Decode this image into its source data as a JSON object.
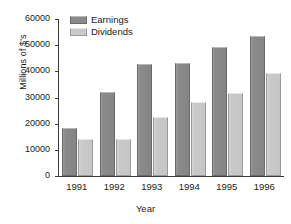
{
  "chart_data": {
    "type": "bar",
    "title": "",
    "xlabel": "Year",
    "ylabel": "Millions of $'s",
    "categories": [
      "1991",
      "1992",
      "1993",
      "1994",
      "1995",
      "1996"
    ],
    "series": [
      {
        "name": "Earnings",
        "color": "#8a8a8a",
        "values": [
          18500,
          32000,
          42800,
          43300,
          49200,
          53500
        ]
      },
      {
        "name": "Dividends",
        "color": "#c9c9c9",
        "values": [
          14200,
          14200,
          22400,
          28400,
          31600,
          39300
        ]
      }
    ],
    "ylim": [
      0,
      60000
    ],
    "yticks": [
      0,
      10000,
      20000,
      30000,
      40000,
      50000,
      60000
    ],
    "ytick_labels": [
      "0",
      "10000",
      "20000",
      "30000",
      "40000",
      "50000",
      "60000"
    ],
    "grid": false,
    "legend_position": "top-left-inside"
  }
}
